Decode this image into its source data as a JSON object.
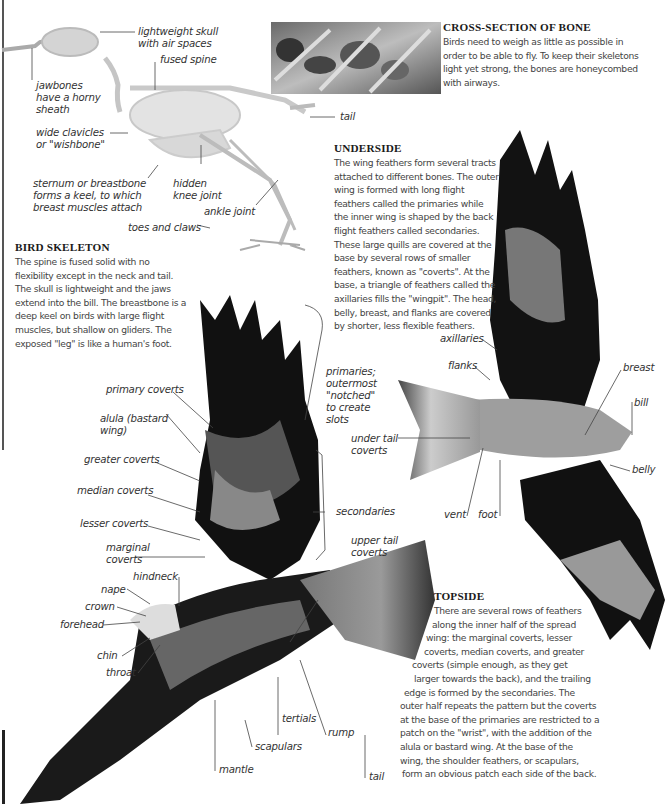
{
  "sections": {
    "cross_section": {
      "heading": "CROSS-SECTION OF BONE",
      "text": "Birds need to weigh as little as possible in order to be able to fly. To keep their skeletons light yet strong, the bones are honeycombed with airways."
    },
    "bird_skeleton": {
      "heading": "BIRD SKELETON",
      "text": "The spine is fused solid with no flexibility except in the neck and tail. The skull is lightweight and the jaws extend into the bill. The breastbone is a deep keel on birds with large flight muscles, but shallow on gliders. The exposed \"leg\" is like a human's foot."
    },
    "underside": {
      "heading": "UNDERSIDE",
      "text": "The wing feathers form several tracts attached to different bones. The outer wing is formed with long flight feathers called the primaries while the inner wing is shaped by the back flight feathers called secondaries. These large quills are covered at the base by several rows of smaller feathers, known as \"coverts\". At the base, a triangle of feathers called the axillaries fills the \"wingpit\". The head, belly, breast, and flanks are covered by shorter, less flexible feathers."
    },
    "topside": {
      "heading": "TOPSIDE",
      "lines": [
        "There are several rows of feathers",
        "along the inner half of the spread",
        "wing: the marginal coverts, lesser",
        "coverts, median coverts, and greater",
        "coverts (simple enough, as they get",
        "larger towards the back), and the trailing",
        "edge is formed by the secondaries. The",
        "outer half repeats the pattern but the coverts",
        "at the base of the primaries are restricted to a",
        "patch on the \"wrist\", with the addition of the",
        "alula or bastard wing. At the base of the",
        "wing, the shoulder feathers, or scapulars,",
        "form an obvious patch each side of the back."
      ]
    }
  },
  "skeleton_labels": {
    "skull": [
      "lightweight skull",
      "with air spaces"
    ],
    "spine": "fused spine",
    "jaw": [
      "jawbones",
      "have a horny",
      "sheath"
    ],
    "clavicles": [
      "wide clavicles",
      "or \"wishbone\""
    ],
    "sternum": [
      "sternum or breastbone",
      "forms a keel, to which",
      "breast muscles attach"
    ],
    "knee": [
      "hidden",
      "knee joint"
    ],
    "ankle": "ankle joint",
    "toes": "toes and claws",
    "tail": "tail"
  },
  "topside_labels": {
    "primary_coverts": "primary coverts",
    "alula": [
      "alula (bastard",
      "wing)"
    ],
    "greater_coverts": "greater coverts",
    "median_coverts": "median coverts",
    "lesser_coverts": "lesser coverts",
    "marginal_coverts": [
      "marginal",
      "coverts"
    ],
    "hindneck": "hindneck",
    "nape": "nape",
    "crown": "crown",
    "forehead": "forehead",
    "chin": "chin",
    "throat": "throat",
    "primaries": [
      "primaries;",
      "outermost",
      "\"notched\"",
      "to create",
      "slots"
    ],
    "secondaries": "secondaries",
    "upper_tail_coverts": [
      "upper tail",
      "coverts"
    ],
    "tertials": "tertials",
    "rump": "rump",
    "scapulars": "scapulars",
    "mantle": "mantle",
    "tail": "tail"
  },
  "underside_labels": {
    "axillaries": "axillaries",
    "flanks": "flanks",
    "breast": "breast",
    "bill": "bill",
    "under_tail_coverts": [
      "under tail",
      "coverts"
    ],
    "belly": "belly",
    "vent": "vent",
    "foot": "foot"
  }
}
